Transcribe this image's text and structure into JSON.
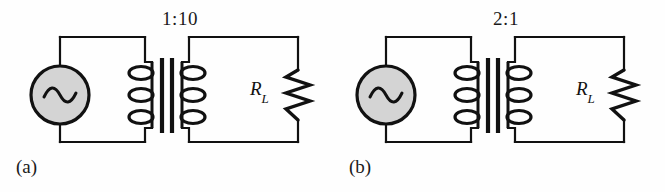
{
  "figure": {
    "background_color": "#fefefe",
    "line_color": "#111111",
    "source_fill_color": "#d4d4d4"
  },
  "panels": [
    {
      "id": "a",
      "caption": "(a)",
      "turns_ratio": "1:10",
      "load_symbol": "R",
      "load_subscript": "L",
      "source_icon": "ac-source-sine-icon",
      "core_icon": "transformer-core-icon",
      "primary_coil_icon": "primary-coil-icon",
      "secondary_coil_icon": "secondary-coil-icon",
      "resistor_icon": "resistor-zigzag-icon"
    },
    {
      "id": "b",
      "caption": "(b)",
      "turns_ratio": "2:1",
      "load_symbol": "R",
      "load_subscript": "L",
      "source_icon": "ac-source-sine-icon",
      "core_icon": "transformer-core-icon",
      "primary_coil_icon": "primary-coil-icon",
      "secondary_coil_icon": "secondary-coil-icon",
      "resistor_icon": "resistor-zigzag-icon"
    }
  ]
}
